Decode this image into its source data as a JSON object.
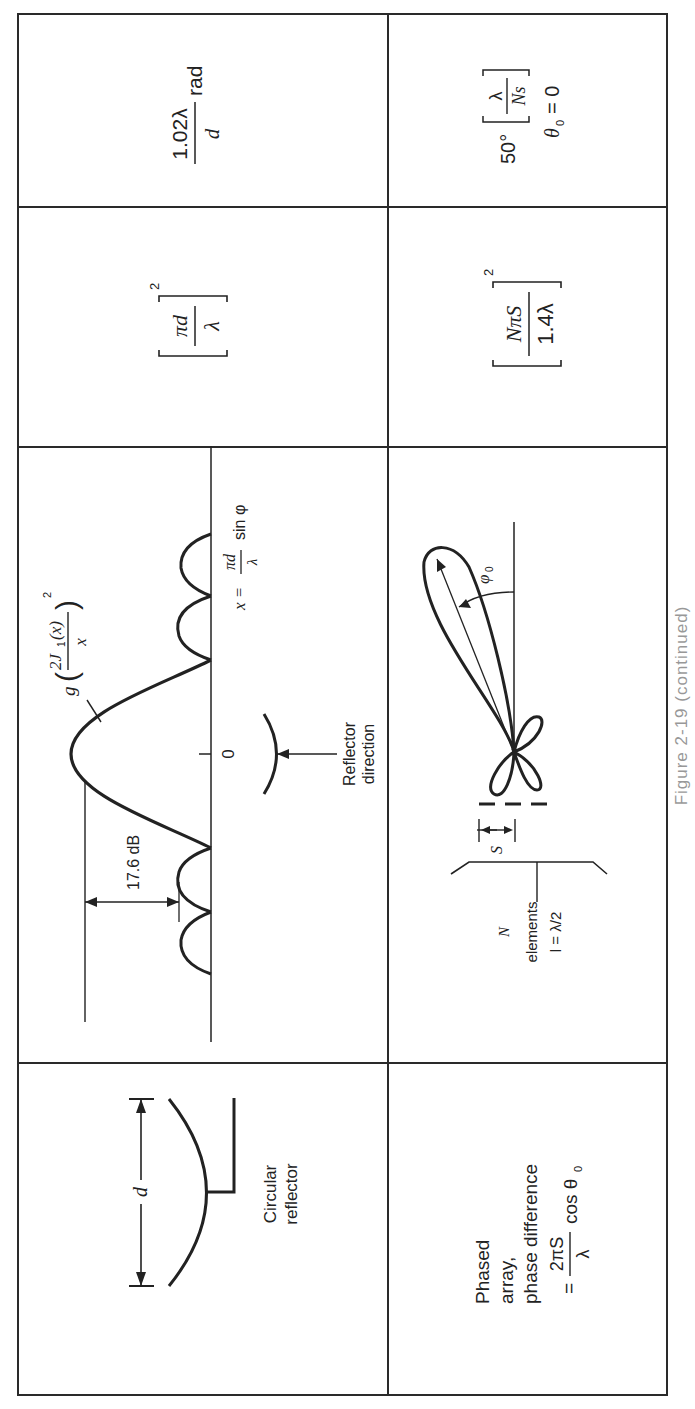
{
  "table": {
    "rows": [
      {
        "id": "circular-reflector",
        "element": {
          "label_lines": [
            "Circular",
            "reflector"
          ],
          "dimension_label": "d"
        },
        "pattern": {
          "function_prefix": "g",
          "function_numerator": "2J",
          "function_subscript": "1",
          "function_arg": "(x)",
          "function_denominator": "x",
          "function_exponent": "2",
          "sidelobe_label": "17.6 dB",
          "origin_label": "0",
          "x_def_lhs": "x =",
          "x_def_num": "πd",
          "x_def_den": "λ",
          "x_def_rhs": "sin φ",
          "reflector_label_lines": [
            "Reflector",
            "direction"
          ]
        },
        "gain": {
          "num": "πd",
          "den": "λ",
          "exp": "2"
        },
        "beamwidth": {
          "num": "1.02λ",
          "den": "d",
          "unit": "rad"
        }
      },
      {
        "id": "phased-array",
        "element": {
          "label_lines": [
            "Phased",
            "array,",
            "phase difference"
          ],
          "formula_eq": "=",
          "formula_num": "2πS",
          "formula_den": "λ",
          "formula_rhs": "cos θ",
          "formula_sub": "0"
        },
        "pattern": {
          "angle_label": "φ",
          "angle_sub": "0",
          "spacing_label": "S",
          "elements_label_lines": [
            "N",
            "elements",
            "l = λ/2"
          ]
        },
        "gain": {
          "num": "NπS",
          "den": "1.4λ",
          "exp": "2"
        },
        "beamwidth": {
          "prefix": "50°",
          "num": "λ",
          "den": "Ns",
          "condition": "θ",
          "condition_sub": "0",
          "condition_rhs": "= 0"
        }
      }
    ]
  },
  "caption_fragment": "Figure 2-19 (continued)"
}
